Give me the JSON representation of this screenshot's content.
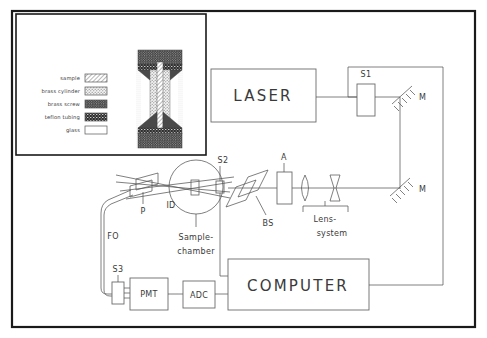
{
  "figure": {
    "background_color": "#ffffff",
    "line_color": "#555555",
    "frame_color": "#1a1a1a"
  },
  "inset": {
    "name": "sample-cell-cross-section",
    "legend": [
      {
        "label": "sample",
        "pattern": "diagonal-hatch"
      },
      {
        "label": "brass cylinder",
        "pattern": "light-stipple"
      },
      {
        "label": "brass screw",
        "pattern": "dark-stipple"
      },
      {
        "label": "teflon tubing",
        "pattern": "dense-dark"
      },
      {
        "label": "glass",
        "pattern": "empty-white"
      }
    ]
  },
  "components": {
    "laser": "LASER",
    "computer": "COMPUTER",
    "pmt": "PMT",
    "adc": "ADC",
    "shutter_1": "S1",
    "shutter_2": "S2",
    "shutter_3": "S3",
    "mirror_top": "M",
    "mirror_bottom": "M",
    "aperture": "A",
    "beam_splitter": "BS",
    "lens_system_line1": "Lens-",
    "lens_system_line2": "system",
    "sample_chamber_line1": "Sample-",
    "sample_chamber_line2": "chamber",
    "polarizer": "P",
    "iris_diaphragm": "ID",
    "fiber_optic": "FO"
  }
}
